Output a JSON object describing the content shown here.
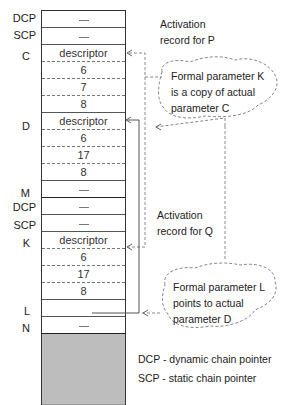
{
  "stack": {
    "cells": [
      {
        "label": "DCP",
        "value": "—",
        "border": "solid"
      },
      {
        "label": "SCP",
        "value": "—",
        "border": "solid"
      },
      {
        "label": "C",
        "value": "descriptor",
        "border": "dashed"
      },
      {
        "label": "",
        "value": "6",
        "border": "dashed"
      },
      {
        "label": "",
        "value": "7",
        "border": "dashed"
      },
      {
        "label": "",
        "value": "8",
        "border": "solid"
      },
      {
        "label": "D",
        "value": "descriptor",
        "border": "dashed"
      },
      {
        "label": "",
        "value": "6",
        "border": "dashed"
      },
      {
        "label": "",
        "value": "17",
        "border": "dashed"
      },
      {
        "label": "",
        "value": "8",
        "border": "solid"
      },
      {
        "label": "M",
        "value": "—",
        "border": "thick"
      },
      {
        "label": "DCP",
        "value": "—",
        "border": "solid"
      },
      {
        "label": "SCP",
        "value": "—",
        "border": "solid"
      },
      {
        "label": "K",
        "value": "descriptor",
        "border": "dashed"
      },
      {
        "label": "",
        "value": "6",
        "border": "dashed"
      },
      {
        "label": "",
        "value": "17",
        "border": "dashed"
      },
      {
        "label": "",
        "value": "8",
        "border": "solid"
      },
      {
        "label": "L",
        "value": "",
        "border": "solid"
      },
      {
        "label": "N",
        "value": "—",
        "border": "solid"
      }
    ]
  },
  "annotations": {
    "activation_p": [
      "Activation",
      "record for P"
    ],
    "activation_q": [
      "Activation",
      "record for Q"
    ],
    "cloud_k": [
      "Formal parameter K",
      "is a copy of actual",
      "parameter C"
    ],
    "cloud_l": [
      "Formal parameter L",
      "points to actual",
      "parameter D"
    ]
  },
  "legend": {
    "dcp": "DCP - dynamic chain pointer",
    "scp": "SCP - static chain pointer"
  }
}
